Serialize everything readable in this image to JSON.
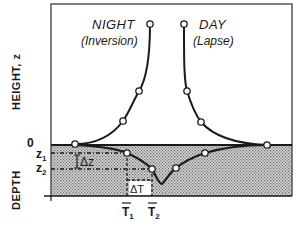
{
  "diagram": {
    "labels": {
      "night_title": "NIGHT",
      "night_subtitle": "(Inversion)",
      "day_title": "DAY",
      "day_subtitle": "(Lapse)",
      "height_axis": "HEIGHT, z",
      "depth_axis": "DEPTH",
      "zero": "0",
      "z1": "z",
      "z1_sub": "1",
      "z2": "z",
      "z2_sub": "2",
      "delta_z": "Δz",
      "delta_t": "ΔT",
      "t1": "T",
      "t1_sub": "1",
      "t2": "T",
      "t2_sub": "2"
    },
    "colors": {
      "line": "#1a1a1a",
      "ground_fill": "#bdbdbd",
      "background": "#ffffff"
    },
    "regions": {
      "atmosphere": "above surface (height)",
      "ground": "below surface (depth), shaded"
    }
  }
}
